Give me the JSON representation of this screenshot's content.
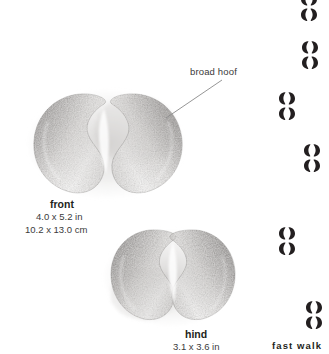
{
  "page": {
    "background_color": "#ffffff",
    "width": 329,
    "height": 354
  },
  "callouts": [
    {
      "id": "broad-hoof",
      "label": "broad hoof"
    }
  ],
  "tracks": [
    {
      "id": "front",
      "name": "front",
      "measure_in": "4.0 x 5.2 in",
      "measure_cm": "10.2 x 13.0 cm",
      "lobes": 2
    },
    {
      "id": "hind",
      "name": "hind",
      "measure_in": "3.1 x 3.6 in",
      "measure_cm": "",
      "lobes": 2
    }
  ],
  "gait": {
    "caption": "fast walk",
    "symbol_color": "#231f20",
    "pattern": [
      {
        "side": "right",
        "prints": 2
      },
      {
        "side": "right",
        "prints": 2
      },
      {
        "side": "left",
        "prints": 2
      },
      {
        "side": "right",
        "prints": 2
      },
      {
        "side": "left",
        "prints": 2
      },
      {
        "side": "right",
        "prints": 2
      }
    ]
  }
}
